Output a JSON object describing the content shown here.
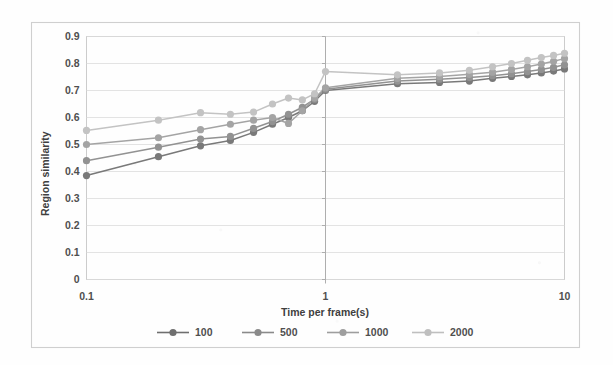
{
  "chart_data": {
    "type": "line",
    "title": "",
    "xlabel": "Time per frame(s)",
    "ylabel": "Region similarity",
    "xscale": "log",
    "xlim": [
      0.1,
      10
    ],
    "ylim": [
      0,
      0.9
    ],
    "ytick_labels": [
      "0",
      "0.1",
      "0.2",
      "0.3",
      "0.4",
      "0.5",
      "0.6",
      "0.7",
      "0.8",
      "0.9"
    ],
    "ytick_values": [
      0,
      0.1,
      0.2,
      0.3,
      0.4,
      0.5,
      0.6,
      0.7,
      0.8,
      0.9
    ],
    "xtick_labels": [
      "0.1",
      "1",
      "10"
    ],
    "xtick_values": [
      0.1,
      1,
      10
    ],
    "grid": true,
    "legend_position": "bottom",
    "x": [
      0.1,
      0.2,
      0.3,
      0.4,
      0.5,
      0.6,
      0.7,
      0.8,
      0.9,
      1.0,
      2.0,
      3.0,
      4.0,
      5.0,
      6.0,
      7.0,
      8.0,
      9.0,
      10.0
    ],
    "series": [
      {
        "name": "100",
        "color": "#6f6f6f",
        "values": [
          0.385,
          0.455,
          0.495,
          0.515,
          0.545,
          0.575,
          0.6,
          0.625,
          0.66,
          0.7,
          0.725,
          0.73,
          0.735,
          0.745,
          0.752,
          0.758,
          0.765,
          0.772,
          0.78
        ]
      },
      {
        "name": "500",
        "color": "#8a8a8a",
        "values": [
          0.44,
          0.49,
          0.52,
          0.53,
          0.56,
          0.585,
          0.612,
          0.638,
          0.668,
          0.705,
          0.735,
          0.742,
          0.748,
          0.755,
          0.762,
          0.77,
          0.778,
          0.786,
          0.795
        ]
      },
      {
        "name": "1000",
        "color": "#9e9e9e",
        "values": [
          0.5,
          0.525,
          0.555,
          0.575,
          0.59,
          0.6,
          0.578,
          0.625,
          0.672,
          0.71,
          0.745,
          0.752,
          0.76,
          0.768,
          0.778,
          0.788,
          0.798,
          0.808,
          0.818
        ]
      },
      {
        "name": "2000",
        "color": "#bfbfbf",
        "values": [
          0.552,
          0.59,
          0.618,
          0.612,
          0.62,
          0.65,
          0.672,
          0.665,
          0.688,
          0.77,
          0.758,
          0.765,
          0.775,
          0.788,
          0.8,
          0.812,
          0.822,
          0.83,
          0.838
        ]
      }
    ],
    "annotations": [
      {
        "name": "vertical-axis-line-at-one",
        "x": 1.0
      }
    ]
  },
  "legend": {
    "items": [
      {
        "label": "100",
        "color": "#6f6f6f"
      },
      {
        "label": "500",
        "color": "#8a8a8a"
      },
      {
        "label": "1000",
        "color": "#9e9e9e"
      },
      {
        "label": "2000",
        "color": "#bfbfbf"
      }
    ]
  }
}
